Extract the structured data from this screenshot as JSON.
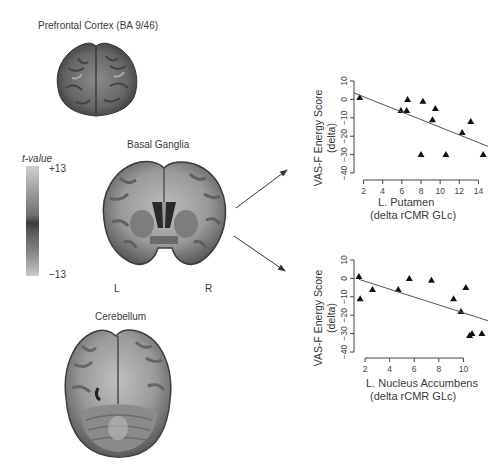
{
  "brain_panels": [
    {
      "title": "Prefrontal Cortex (BA 9/46)"
    },
    {
      "title": "Basal Ganglia",
      "left_label": "L",
      "right_label": "R"
    },
    {
      "title": "Cerebellum"
    }
  ],
  "colorbar": {
    "title": "t-value",
    "max_label": "+13",
    "min_label": "−13",
    "colors": [
      "#cfcfcf",
      "#9a9a9a",
      "#3b3b3b",
      "#8a8a8a",
      "#c9c9c9"
    ]
  },
  "chart_data": [
    {
      "type": "scatter",
      "title": "",
      "ylabel": "VAS-F Energy Score (delta)",
      "ylabel_line1": "VAS-F Energy Score",
      "ylabel_line2": "(delta)",
      "xlabel": "L. Putamen (delta rCMR GLc)",
      "xlabel_line1": "L. Putamen",
      "xlabel_line2": "(delta rCMR GLc)",
      "xlim": [
        1,
        15
      ],
      "ylim": [
        -42,
        12
      ],
      "xticks": [
        2,
        4,
        6,
        8,
        10,
        12,
        14
      ],
      "yticks": [
        10,
        0,
        -10,
        -20,
        -30,
        -40
      ],
      "marker": "triangle",
      "grid": false,
      "points": [
        {
          "x": 1.6,
          "y": 1
        },
        {
          "x": 5.9,
          "y": -6
        },
        {
          "x": 6.5,
          "y": -6
        },
        {
          "x": 6.6,
          "y": 0
        },
        {
          "x": 8.2,
          "y": -1
        },
        {
          "x": 9.5,
          "y": -5
        },
        {
          "x": 9.2,
          "y": -11
        },
        {
          "x": 8.0,
          "y": -30
        },
        {
          "x": 10.6,
          "y": -30
        },
        {
          "x": 12.3,
          "y": -18
        },
        {
          "x": 13.2,
          "y": -12
        },
        {
          "x": 14.5,
          "y": -30
        }
      ],
      "fit_line": {
        "x": [
          1,
          15
        ],
        "y": [
          3.5,
          -25.5
        ]
      }
    },
    {
      "type": "scatter",
      "title": "",
      "ylabel": "VAS-F Energy Score (delta)",
      "ylabel_line1": "VAS-F Energy Score",
      "ylabel_line2": "(delta)",
      "xlabel": "L. Nucleus Accumbens (delta rCMR GLc)",
      "xlabel_line1": "L. Nucleus Accumbens",
      "xlabel_line2": "(delta rCMR GLc)",
      "xlim": [
        1.1,
        12
      ],
      "ylim": [
        -42,
        12
      ],
      "xticks": [
        2,
        4,
        6,
        8,
        10
      ],
      "yticks": [
        10,
        0,
        -10,
        -20,
        -30,
        -40
      ],
      "marker": "triangle",
      "grid": false,
      "points": [
        {
          "x": 1.5,
          "y": 1
        },
        {
          "x": 1.6,
          "y": -11
        },
        {
          "x": 2.6,
          "y": -6
        },
        {
          "x": 4.7,
          "y": -6
        },
        {
          "x": 5.6,
          "y": 0
        },
        {
          "x": 7.4,
          "y": -1
        },
        {
          "x": 9.2,
          "y": -11
        },
        {
          "x": 9.8,
          "y": -18
        },
        {
          "x": 10.2,
          "y": -5
        },
        {
          "x": 10.5,
          "y": -31
        },
        {
          "x": 10.7,
          "y": -30
        },
        {
          "x": 11.5,
          "y": -30
        }
      ],
      "fit_line": {
        "x": [
          1.5,
          12
        ],
        "y": [
          -0.5,
          -23
        ]
      }
    }
  ],
  "arrows": [
    {
      "from": "basal-ganglia",
      "to": "putamen-plot"
    },
    {
      "from": "basal-ganglia",
      "to": "accumbens-plot"
    }
  ]
}
